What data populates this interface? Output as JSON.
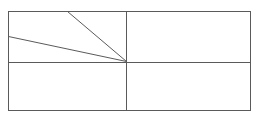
{
  "diagram": {
    "type": "geometric-line-figure",
    "stroke_color": "#5a5a5a",
    "background": "#ffffff",
    "outer_rect": {
      "x1": 8,
      "y1": 11,
      "x2": 250,
      "y2": 110
    },
    "dividers": [
      {
        "name": "vertical-divider",
        "x1": 126,
        "y1": 11,
        "x2": 126,
        "y2": 110
      },
      {
        "name": "horizontal-divider",
        "x1": 8,
        "y1": 62,
        "x2": 250,
        "y2": 62
      }
    ],
    "diagonals": [
      {
        "name": "steep-diagonal",
        "x1": 67,
        "y1": 11,
        "x2": 126,
        "y2": 61
      },
      {
        "name": "shallow-diagonal",
        "x1": 8,
        "y1": 36,
        "x2": 126,
        "y2": 61
      }
    ]
  }
}
